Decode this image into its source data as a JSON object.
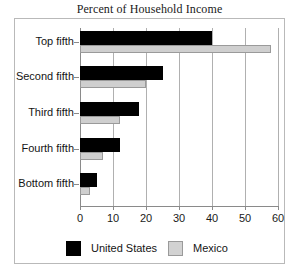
{
  "chart_data": {
    "type": "bar",
    "orientation": "horizontal",
    "title": "Percent of Household Income",
    "xlabel": "",
    "ylabel": "",
    "xlim": [
      0,
      60
    ],
    "xticks": [
      "0",
      "10",
      "20",
      "30",
      "40",
      "50",
      "60"
    ],
    "grid": true,
    "legend_position": "bottom",
    "categories": [
      "Top fifth",
      "Second fifth",
      "Third fifth",
      "Fourth fifth",
      "Bottom fifth"
    ],
    "series": [
      {
        "name": "United States",
        "color": "#000000",
        "values": [
          40,
          25,
          18,
          12,
          5
        ]
      },
      {
        "name": "Mexico",
        "color": "#cfcfcf",
        "values": [
          58,
          20,
          12,
          7,
          3
        ]
      }
    ]
  },
  "legend": {
    "entries": [
      {
        "label": "United States"
      },
      {
        "label": "Mexico"
      }
    ]
  }
}
